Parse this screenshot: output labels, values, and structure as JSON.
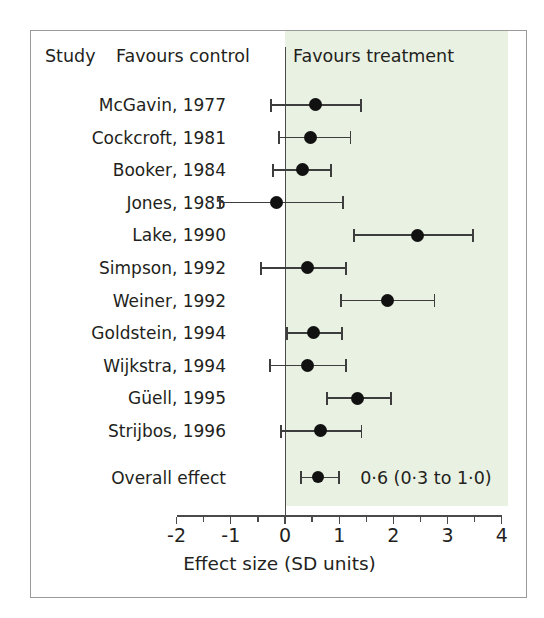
{
  "figure": {
    "header": {
      "study_label": "Study",
      "favours_control": "Favours control",
      "favours_treatment": "Favours treatment"
    },
    "overall_label": "Overall effect",
    "overall_value_text": "0·6 (0·3 to 1·0)",
    "xlabel": "Effect size (SD units)",
    "colors": {
      "panel_background": "#e9f1e2",
      "marker": "#111111",
      "line": "#3d3d3d",
      "axis": "#4a4a4a",
      "text": "#231f20",
      "border": "#9a9a9a"
    }
  },
  "chart_data": {
    "type": "scatter",
    "subtype": "forest-plot",
    "title": "",
    "xlabel": "Effect size (SD units)",
    "ylabel": "Study",
    "xlim": [
      -2,
      4
    ],
    "xticks": [
      -2,
      -1,
      0,
      1,
      2,
      3,
      4
    ],
    "xticklabels": [
      "-2",
      "-1",
      "0",
      "1",
      "2",
      "3",
      "4"
    ],
    "minor_tick_step": 0.5,
    "grid": false,
    "legend": false,
    "reference_line": 0,
    "annotations": [
      {
        "text": "Favours control",
        "side": "left-of-reference"
      },
      {
        "text": "Favours treatment",
        "side": "right-of-reference"
      }
    ],
    "categories": [
      "McGavin, 1977",
      "Cockcroft, 1981",
      "Booker, 1984",
      "Jones, 1985",
      "Lake, 1990",
      "Simpson, 1992",
      "Weiner, 1992",
      "Goldstein, 1994",
      "Wijkstra, 1994",
      "Güell, 1995",
      "Strijbos, 1996"
    ],
    "studies": [
      {
        "label": "McGavin, 1977",
        "effect": 0.57,
        "ci_low": -0.26,
        "ci_high": 1.4
      },
      {
        "label": "Cockcroft, 1981",
        "effect": 0.47,
        "ci_low": -0.11,
        "ci_high": 1.21
      },
      {
        "label": "Booker, 1984",
        "effect": 0.32,
        "ci_low": -0.22,
        "ci_high": 0.85
      },
      {
        "label": "Jones, 1985",
        "effect": -0.16,
        "ci_low": -1.2,
        "ci_high": 1.07
      },
      {
        "label": "Lake, 1990",
        "effect": 2.44,
        "ci_low": 1.27,
        "ci_high": 3.47
      },
      {
        "label": "Simpson, 1992",
        "effect": 0.41,
        "ci_low": -0.45,
        "ci_high": 1.12
      },
      {
        "label": "Weiner, 1992",
        "effect": 1.9,
        "ci_low": 1.03,
        "ci_high": 2.76
      },
      {
        "label": "Goldstein, 1994",
        "effect": 0.52,
        "ci_low": 0.04,
        "ci_high": 1.05
      },
      {
        "label": "Wijkstra, 1994",
        "effect": 0.41,
        "ci_low": -0.28,
        "ci_high": 1.12
      },
      {
        "label": "Güell, 1995",
        "effect": 1.33,
        "ci_low": 0.78,
        "ci_high": 1.95
      },
      {
        "label": "Strijbos, 1996",
        "effect": 0.66,
        "ci_low": -0.08,
        "ci_high": 1.41
      }
    ],
    "overall": {
      "label": "Overall effect",
      "effect": 0.6,
      "ci_low": 0.3,
      "ci_high": 1.0,
      "text": "0·6 (0·3 to 1·0)"
    }
  }
}
